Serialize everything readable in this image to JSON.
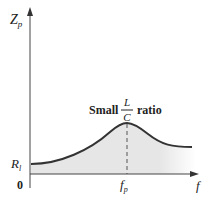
{
  "diagram": {
    "y_axis": {
      "label": "Z",
      "label_sub": "p"
    },
    "x_axis": {
      "label": "f"
    },
    "origin_label": "0",
    "baseline_label": {
      "main": "R",
      "sub": "l"
    },
    "peak_marker": {
      "main": "f",
      "sub": "p"
    },
    "annotation": {
      "prefix": "Small",
      "fraction_numerator": "L",
      "fraction_denominator": "C",
      "suffix": "ratio"
    },
    "colors": {
      "axis": "#333333",
      "curve": "#333333",
      "fill": "#e6e6e6",
      "dashed": "#555555"
    }
  }
}
